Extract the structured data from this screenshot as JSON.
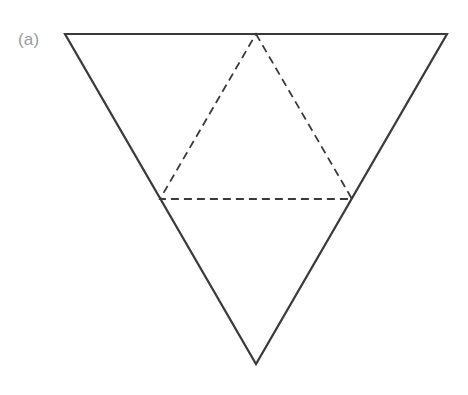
{
  "figure": {
    "panel_label": "(a)",
    "panel_label_color": "#9a9a9a",
    "background_color": "#ffffff",
    "stroke_color": "#3a3a3c",
    "solid_stroke_width": 2.2,
    "dashed_stroke_width": 1.8,
    "dash_pattern": "8,5",
    "canvas": {
      "width": 468,
      "height": 395
    },
    "shapes": [
      {
        "name": "outer-triangle",
        "style": "solid",
        "orientation": "point-down",
        "vertices": [
          {
            "label": "top-left",
            "x": 65,
            "y": 34
          },
          {
            "label": "top-right",
            "x": 447,
            "y": 34
          },
          {
            "label": "bottom-apex",
            "x": 256,
            "y": 364
          }
        ],
        "points": "65,34 447,34 256,364"
      },
      {
        "name": "inner-triangle",
        "style": "dashed",
        "orientation": "point-up",
        "vertices": [
          {
            "label": "top-apex-midpoint-of-top-edge",
            "x": 256,
            "y": 34
          },
          {
            "label": "left-midpoint-of-left-edge",
            "x": 160,
            "y": 199
          },
          {
            "label": "right-midpoint-of-right-edge",
            "x": 352,
            "y": 199
          }
        ],
        "points": "256,34 352,199 160,199"
      }
    ]
  }
}
